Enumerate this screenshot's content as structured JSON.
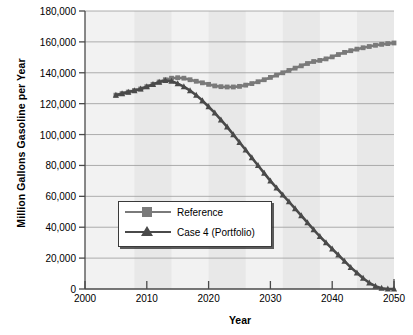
{
  "chart_data": {
    "type": "line",
    "title": "",
    "xlabel": "Year",
    "ylabel": "Million Gallons Gasoline per Year",
    "xlim": [
      2000,
      2050
    ],
    "ylim": [
      0,
      180000
    ],
    "xticks": [
      2000,
      2010,
      2020,
      2030,
      2040,
      2050
    ],
    "xtick_labels": [
      "2000",
      "2010",
      "2020",
      "2030",
      "2040",
      "2050"
    ],
    "yticks": [
      0,
      20000,
      40000,
      60000,
      80000,
      100000,
      120000,
      140000,
      160000,
      180000
    ],
    "ytick_labels": [
      "0",
      "20,000",
      "40,000",
      "60,000",
      "80,000",
      "100,000",
      "120,000",
      "140,000",
      "160,000",
      "180,000"
    ],
    "grid": "horizontal",
    "legend_position": "center-left",
    "plot_bg": "#f2f2f2",
    "band_color": "#e8e8e8",
    "shaded_bands": [
      [
        2008,
        2014
      ],
      [
        2020,
        2026
      ],
      [
        2032,
        2038
      ],
      [
        2044,
        2050
      ]
    ],
    "series": [
      {
        "name": "Reference",
        "color": "#7a7a7a",
        "marker": "square",
        "x": [
          2005,
          2006,
          2007,
          2008,
          2009,
          2010,
          2011,
          2012,
          2013,
          2014,
          2015,
          2016,
          2017,
          2018,
          2019,
          2020,
          2021,
          2022,
          2023,
          2024,
          2025,
          2026,
          2027,
          2028,
          2029,
          2030,
          2031,
          2032,
          2033,
          2034,
          2035,
          2036,
          2037,
          2038,
          2039,
          2040,
          2041,
          2042,
          2043,
          2044,
          2045,
          2046,
          2047,
          2048,
          2049,
          2050
        ],
        "y": [
          125500,
          126500,
          127500,
          128500,
          129500,
          131000,
          132500,
          134000,
          135500,
          136500,
          136800,
          136500,
          135500,
          134500,
          133500,
          132500,
          131500,
          131000,
          130800,
          130800,
          131200,
          132000,
          133000,
          134200,
          135500,
          137000,
          138500,
          140000,
          141500,
          143000,
          144500,
          146000,
          147300,
          148000,
          149000,
          150300,
          151800,
          153200,
          154300,
          155300,
          156200,
          157000,
          157800,
          158400,
          158900,
          159300
        ]
      },
      {
        "name": "Case 4 (Portfolio)",
        "color": "#4a4a4a",
        "marker": "triangle",
        "x": [
          2005,
          2006,
          2007,
          2008,
          2009,
          2010,
          2011,
          2012,
          2013,
          2014,
          2015,
          2016,
          2017,
          2018,
          2019,
          2020,
          2021,
          2022,
          2023,
          2024,
          2025,
          2026,
          2027,
          2028,
          2029,
          2030,
          2031,
          2032,
          2033,
          2034,
          2035,
          2036,
          2037,
          2038,
          2039,
          2040,
          2041,
          2042,
          2043,
          2044,
          2045,
          2046,
          2047,
          2048,
          2049,
          2050
        ],
        "y": [
          125500,
          126500,
          127500,
          128500,
          129500,
          131000,
          132500,
          134000,
          135000,
          134500,
          133000,
          131000,
          128500,
          125500,
          122000,
          118000,
          114000,
          109500,
          105000,
          100000,
          95000,
          90000,
          85000,
          80000,
          75000,
          70000,
          65500,
          61000,
          56500,
          52000,
          47500,
          43000,
          38500,
          34000,
          30000,
          26000,
          22000,
          18000,
          14000,
          10500,
          7000,
          4000,
          1800,
          500,
          0,
          0
        ]
      }
    ]
  },
  "axis_titles": {
    "y": "Million Gallons Gasoline per Year",
    "x": "Year"
  },
  "legend": {
    "items": [
      {
        "label": "Reference",
        "marker": "square-marker-icon"
      },
      {
        "label": "Case 4 (Portfolio)",
        "marker": "triangle-marker-icon"
      }
    ]
  }
}
